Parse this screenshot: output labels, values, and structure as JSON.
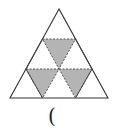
{
  "diagram": {
    "rows": 3,
    "shaded_count": 3,
    "colors": {
      "outline": "#333333",
      "shade": "#b4b4b4",
      "background": "#ffffff"
    }
  },
  "answer_blank": "("
}
